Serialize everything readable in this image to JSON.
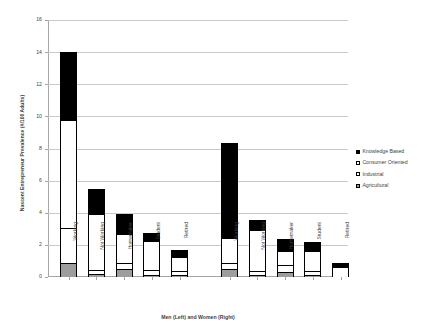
{
  "chart_data": {
    "type": "bar",
    "subtype": "stacked",
    "title": "",
    "xlabel": "Men (Left) and Women (Right)",
    "ylabel": "Nascent Entrepreneur Prevalence (#/100 Adults)",
    "ylim": [
      0,
      16
    ],
    "ytick_step": 2,
    "yticks": [
      0,
      2,
      4,
      6,
      8,
      10,
      12,
      14,
      16
    ],
    "ytick_labels": [
      "0",
      "2",
      "4",
      "6",
      "8",
      "10",
      "12",
      "14",
      "16"
    ],
    "grid": "horizontal",
    "legend_position": "right",
    "groups": [
      "Men (Left)",
      "Women (Right)"
    ],
    "categories": [
      "Working",
      "Not Working",
      "Homemaker",
      "Student",
      "Retired",
      "Working",
      "Not Working",
      "Homemaker",
      "Student",
      "Retired"
    ],
    "series": [
      {
        "name": "Agricultural",
        "color": "#9d9d9d",
        "pattern": "solid-gray",
        "values": [
          0.85,
          0.2,
          0.5,
          0.15,
          0.1,
          0.5,
          0.15,
          0.3,
          0.1,
          0.0
        ]
      },
      {
        "name": "Industrial",
        "color": "#ffffff",
        "pattern": "checkered",
        "values": [
          2.2,
          0.25,
          0.35,
          0.3,
          0.25,
          0.4,
          0.2,
          0.45,
          0.25,
          0.0
        ]
      },
      {
        "name": "Consumer Oriented",
        "color": "#ffffff",
        "pattern": "open",
        "values": [
          6.7,
          3.45,
          1.8,
          1.8,
          0.9,
          1.55,
          2.55,
          0.85,
          1.25,
          0.6
        ]
      },
      {
        "name": "Knowledge Based",
        "color": "#000000",
        "pattern": "solid-black",
        "values": [
          4.25,
          1.6,
          1.25,
          0.5,
          0.45,
          5.9,
          0.65,
          0.75,
          0.6,
          0.3
        ]
      }
    ],
    "totals": [
      14.0,
      5.5,
      3.9,
      2.75,
      1.7,
      8.35,
      3.55,
      2.35,
      2.2,
      0.9
    ]
  },
  "legend": {
    "items": [
      {
        "label": "Knowledge Based",
        "swatch": "solid-black-swatch"
      },
      {
        "label": "Consumer Oriented",
        "swatch": "open-white-swatch"
      },
      {
        "label": "Industrial",
        "swatch": "checkered-swatch"
      },
      {
        "label": "Agricultural",
        "swatch": "gray-swatch"
      }
    ]
  }
}
